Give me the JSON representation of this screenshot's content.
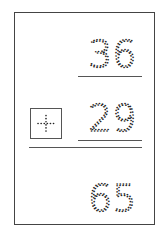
{
  "worksheet": {
    "top_number": "36",
    "bottom_number": "29",
    "operator": "+",
    "answer": "65",
    "style": "dotted-tracing",
    "ink_color": "#222222",
    "line_color": "#555555"
  }
}
